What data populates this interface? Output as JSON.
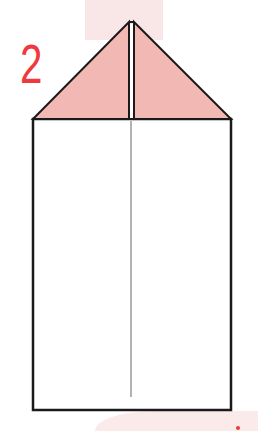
{
  "diagram": {
    "step_number": "2",
    "colors": {
      "step_number": "#ee3a3f",
      "flap_fill": "#f2b8b4",
      "paper_fill": "#ffffff",
      "outline": "#1a1a1a",
      "fold_line": "#555555",
      "background_band": "#f9e6e6"
    },
    "shapes": [
      {
        "name": "left-flap",
        "type": "triangle",
        "points": [
          [
            33,
            119
          ],
          [
            129,
            22
          ],
          [
            129,
            119
          ]
        ]
      },
      {
        "name": "right-flap",
        "type": "triangle",
        "points": [
          [
            134,
            22
          ],
          [
            231,
            119
          ],
          [
            134,
            119
          ]
        ]
      },
      {
        "name": "paper-body",
        "type": "rect",
        "x": 33,
        "y": 119,
        "width": 198,
        "height": 291
      },
      {
        "name": "center-crease",
        "type": "line",
        "from": [
          131,
          120
        ],
        "to": [
          131,
          397
        ]
      }
    ]
  }
}
